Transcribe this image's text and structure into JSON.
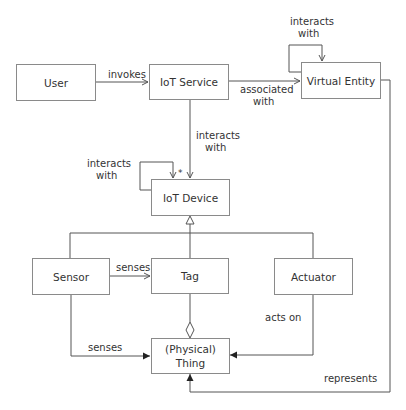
{
  "diagram": {
    "type": "uml-domain-model",
    "line_color": "#555555",
    "box_border_color": "#8a8a8a",
    "nodes": {
      "user": "User",
      "iot_service": "IoT Service",
      "virtual_entity": "Virtual Entity",
      "iot_device": "IoT Device",
      "sensor": "Sensor",
      "tag": "Tag",
      "actuator": "Actuator",
      "thing": "(Physical)\nThing"
    },
    "thing_lines": [
      "(Physical)",
      "Thing"
    ],
    "edges": {
      "invokes": "invokes",
      "associated_with_1": "associated",
      "associated_with_2": "with",
      "ve_self_1": "interacts",
      "ve_self_2": "with",
      "service_device_1": "interacts",
      "service_device_2": "with",
      "device_self_1": "interacts",
      "device_self_2": "with",
      "device_self_multiplicity": "*",
      "sensor_tag": "senses",
      "sensor_thing": "senses",
      "actuator_thing": "acts on",
      "ve_thing": "represents"
    },
    "relations": [
      {
        "from": "User",
        "to": "IoT Service",
        "label": "invokes",
        "kind": "association-arrow"
      },
      {
        "from": "IoT Service",
        "to": "Virtual Entity",
        "label": "associated with",
        "kind": "association-arrow"
      },
      {
        "from": "Virtual Entity",
        "to": "Virtual Entity",
        "label": "interacts with",
        "kind": "self-association"
      },
      {
        "from": "IoT Service",
        "to": "IoT Device",
        "label": "interacts with",
        "kind": "association-arrow"
      },
      {
        "from": "IoT Device",
        "to": "IoT Device",
        "label": "interacts with",
        "multiplicity": "*",
        "kind": "self-association"
      },
      {
        "from": "Sensor",
        "to": "IoT Device",
        "kind": "generalization"
      },
      {
        "from": "Tag",
        "to": "IoT Device",
        "kind": "generalization"
      },
      {
        "from": "Actuator",
        "to": "IoT Device",
        "kind": "generalization"
      },
      {
        "from": "Sensor",
        "to": "Tag",
        "label": "senses",
        "kind": "association-arrow"
      },
      {
        "from": "Tag",
        "to": "(Physical) Thing",
        "kind": "aggregation"
      },
      {
        "from": "Sensor",
        "to": "(Physical) Thing",
        "label": "senses",
        "kind": "association-arrow"
      },
      {
        "from": "Actuator",
        "to": "(Physical) Thing",
        "label": "acts on",
        "kind": "association-arrow"
      },
      {
        "from": "Virtual Entity",
        "to": "(Physical) Thing",
        "label": "represents",
        "kind": "association-arrow"
      }
    ]
  }
}
